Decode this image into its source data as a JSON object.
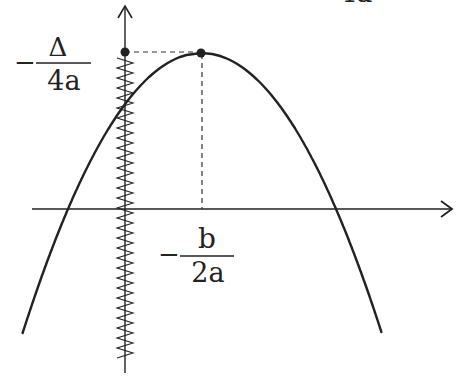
{
  "diagram": {
    "type": "parabola-vertex-diagram",
    "colors": {
      "stroke": "#222222",
      "background": "#ffffff"
    },
    "labels": {
      "y_vertex": {
        "sign": "−",
        "numerator": "Δ",
        "denominator": "4a"
      },
      "x_vertex": {
        "sign": "−",
        "numerator": "b",
        "denominator": "2a"
      },
      "top_cutoff": {
        "text": "4a"
      }
    },
    "points": [
      {
        "name": "vertex",
        "x": 201,
        "y": 53
      },
      {
        "name": "y-axis-projection",
        "x": 125,
        "y": 52
      }
    ],
    "axes": {
      "x_axis": {
        "y": 209,
        "x_start": 32,
        "x_end": 452,
        "arrow": true
      },
      "y_axis": {
        "x": 125,
        "y_start": 373,
        "y_end": 5,
        "arrow": true
      }
    },
    "roots": [
      68,
      336
    ]
  }
}
